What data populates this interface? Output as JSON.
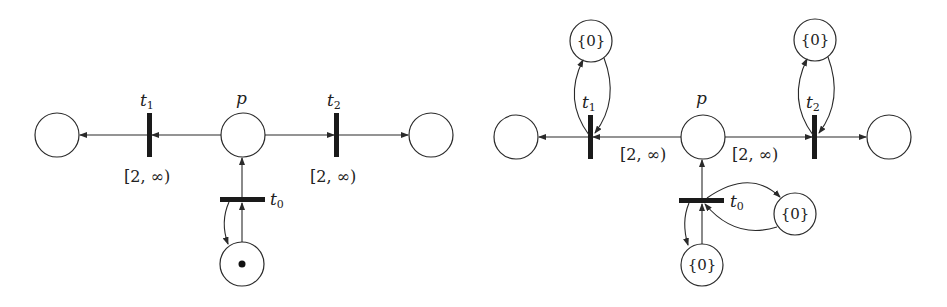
{
  "left_net": {
    "place_p": {
      "label": "p"
    },
    "t0": {
      "label": "t",
      "sub": "0"
    },
    "t1": {
      "label": "t",
      "sub": "1",
      "interval": "[2, ∞)"
    },
    "t2": {
      "label": "t",
      "sub": "2",
      "interval": "[2, ∞)"
    },
    "token": "marked"
  },
  "right_net": {
    "place_p": {
      "label": "p"
    },
    "t0": {
      "label": "t",
      "sub": "0"
    },
    "t1": {
      "label": "t",
      "sub": "1"
    },
    "t2": {
      "label": "t",
      "sub": "2"
    },
    "arc_p_t1_interval": "[2, ∞)",
    "arc_p_t2_interval": "[2, ∞)",
    "clock_place_t1": "{0}",
    "clock_place_t2": "{0}",
    "clock_place_t0_right": "{0}",
    "clock_place_t0_bottom": "{0}"
  }
}
